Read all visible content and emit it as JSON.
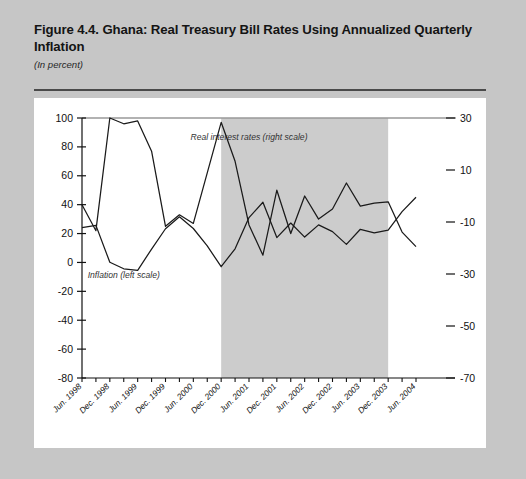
{
  "figure": {
    "title": "Figure 4.4. Ghana: Real Treasury Bill Rates Using Annualized Quarterly Inflation",
    "subtitle": "(In percent)",
    "note": "Note: Shaded area denotes the aid-surge period."
  },
  "colors": {
    "page_background": "#c6c6c6",
    "plot_background": "#ffffff",
    "shaded_band": "#cccccc",
    "line": "#1a1a1a",
    "rule": "#4a4a4a",
    "text": "#141414"
  },
  "chart_data": {
    "type": "line",
    "title": "Figure 4.4. Ghana: Real Treasury Bill Rates Using Annualized Quarterly Inflation",
    "subtitle": "(In percent)",
    "xlabel": "",
    "ylabel": "In percent",
    "grid": false,
    "legend_position": "inline-annotations",
    "x": [
      "Jun 1998",
      "Sep 1998",
      "Dec 1998",
      "Mar 1999",
      "Jun 1999",
      "Sep 1999",
      "Dec 1999",
      "Mar 2000",
      "Jun 2000",
      "Sep 2000",
      "Dec 2000",
      "Mar 2001",
      "Jun 2001",
      "Sep 2001",
      "Dec 2001",
      "Mar 2002",
      "Jun 2002",
      "Sep 2002",
      "Dec 2002",
      "Mar 2003",
      "Jun 2003",
      "Sep 2003",
      "Dec 2003",
      "Mar 2004",
      "Jun 2004"
    ],
    "x_tick_labels": [
      "Jun. 1998",
      "Dec. 1998",
      "Jun. 1999",
      "Dec. 1999",
      "Jun. 2000",
      "Dec. 2000",
      "Jun. 2001",
      "Dec. 2001",
      "Jun. 2002",
      "Dec. 2002",
      "Jun. 2003",
      "Dec. 2003",
      "Jun. 2004"
    ],
    "left_axis": {
      "label": "Inflation (left scale)",
      "ylim": [
        -80,
        100
      ],
      "ticks": [
        100,
        80,
        60,
        40,
        20,
        0,
        -20,
        -40,
        -60,
        -80
      ]
    },
    "right_axis": {
      "label": "Real interest rates (right scale)",
      "ylim": [
        -70,
        30
      ],
      "ticks": [
        30,
        10,
        -10,
        -30,
        -50,
        -70
      ]
    },
    "series": [
      {
        "name": "Inflation (left scale)",
        "axis": "left",
        "values": [
          40,
          22,
          100,
          96,
          98,
          77,
          25,
          33,
          27,
          62,
          97,
          70,
          26,
          5,
          50,
          20,
          46,
          30,
          37,
          55,
          39,
          41,
          42,
          21,
          11
        ]
      },
      {
        "name": "Real interest rates (right scale)",
        "axis": "right",
        "values": [
          -12.2,
          -11.3,
          -25.5,
          -28.0,
          -28.6,
          -20.4,
          -12.6,
          -8.0,
          -12.5,
          -19.2,
          -27.2,
          -20.3,
          -8.3,
          -2.4,
          -16.0,
          -10.4,
          -15.8,
          -11.1,
          -13.7,
          -18.6,
          -12.8,
          -14.2,
          -13.1,
          -6.0,
          -0.5
        ]
      }
    ],
    "shaded_band": {
      "label": "aid-surge period",
      "start": "Dec 2000",
      "end": "Dec 2003"
    },
    "annotations": [
      {
        "text": "Inflation (left scale)",
        "x": "Mar 1999",
        "y": -11
      },
      {
        "text": "Real interest rates (right scale)",
        "x": "Jun 2001",
        "y": 85
      }
    ]
  }
}
